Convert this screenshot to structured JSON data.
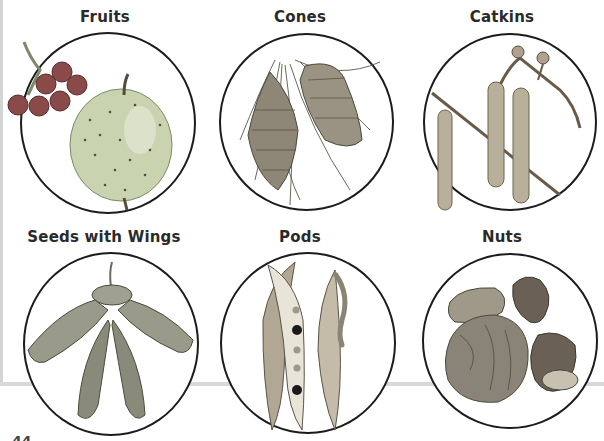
{
  "figure": {
    "panels": [
      {
        "id": "fruits",
        "title": "Fruits",
        "illustration": "apple-and-berries"
      },
      {
        "id": "cones",
        "title": "Cones",
        "illustration": "pine-cones"
      },
      {
        "id": "catkins",
        "title": "Catkins",
        "illustration": "birch-catkins"
      },
      {
        "id": "seeds-with-wings",
        "title": "Seeds with Wings",
        "illustration": "maple-samaras"
      },
      {
        "id": "pods",
        "title": "Pods",
        "illustration": "bean-pods"
      },
      {
        "id": "nuts",
        "title": "Nuts",
        "illustration": "assorted-nuts"
      }
    ],
    "page_number": "44"
  }
}
